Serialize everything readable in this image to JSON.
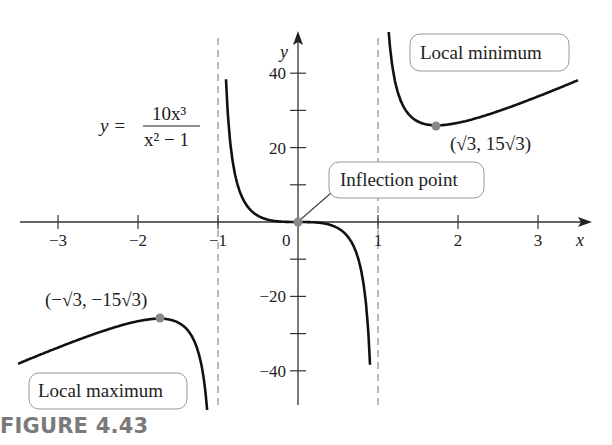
{
  "chart_data": {
    "type": "line",
    "title": "",
    "function_label": {
      "lhs": "y =",
      "numerator": "10x³",
      "denominator": "x² − 1"
    },
    "xlabel": "x",
    "ylabel": "y",
    "xlim": [
      -3.6,
      3.6
    ],
    "ylim": [
      -50,
      50
    ],
    "x_ticks": [
      -3,
      -2,
      -1,
      0,
      1,
      2,
      3
    ],
    "x_tick_labels": [
      "−3",
      "−2",
      "−1",
      "0",
      "1",
      "2",
      "3"
    ],
    "y_ticks": [
      -40,
      -30,
      -20,
      -10,
      10,
      20,
      30,
      40
    ],
    "y_tick_labels": {
      "40": "40",
      "20": "20",
      "-20": "−20",
      "-40": "−40"
    },
    "grid": false,
    "vertical_asymptotes": [
      -1,
      1
    ],
    "series": [
      {
        "name": "y = 10x^3/(x^2-1)",
        "formula": "10*x^3/(x^2-1)",
        "domain_pieces": [
          [
            -3.5,
            -1.04
          ],
          [
            -0.95,
            0.95
          ],
          [
            1.04,
            3.5
          ]
        ]
      }
    ],
    "points": [
      {
        "name": "local-maximum",
        "x": -1.732,
        "y": -25.98,
        "label": "(−√3, −15√3)"
      },
      {
        "name": "inflection-point",
        "x": 0,
        "y": 0,
        "label": "Inflection point"
      },
      {
        "name": "local-minimum",
        "x": 1.732,
        "y": 25.98,
        "label": "(√3, 15√3)"
      }
    ],
    "annotations": [
      {
        "text": "Local minimum",
        "boxed": true
      },
      {
        "text": "Inflection point",
        "boxed": true,
        "pointer_to": [
          0,
          0
        ]
      },
      {
        "text": "Local maximum",
        "boxed": true
      },
      {
        "text": "(√3, 15√3)"
      },
      {
        "text": "(−√3, −15√3)"
      }
    ]
  },
  "labels": {
    "local_min": "Local minimum",
    "local_max": "Local maximum",
    "inflection": "Inflection point",
    "min_coord": "(√3, 15√3)",
    "max_coord": "(−√3, −15√3)",
    "x_axis": "x",
    "y_axis": "y",
    "eq_lhs": "y =",
    "eq_num": "10x³",
    "eq_den": "x² − 1"
  },
  "caption": "FIGURE 4.43",
  "colors": {
    "curve": "#111111",
    "axis": "#333333",
    "asymptote": "#777777",
    "point": "#888888",
    "box_border": "#999999",
    "caption": "#7a7a7a"
  }
}
